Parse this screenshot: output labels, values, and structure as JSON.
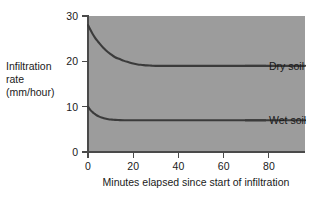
{
  "chart_data": {
    "type": "line",
    "title": "",
    "xlabel": "Minutes elapsed since start of infiltration",
    "ylabel": "Infiltration rate (mm/hour)",
    "ylabel_lines": [
      "Infiltration",
      "rate",
      "(mm/hour)"
    ],
    "xlim": [
      0,
      96
    ],
    "ylim": [
      0,
      30
    ],
    "xticks": [
      0,
      20,
      40,
      60,
      80
    ],
    "yticks": [
      0,
      10,
      20,
      30
    ],
    "xticklabels": [
      "0",
      "20",
      "40",
      "60",
      "80"
    ],
    "yticklabels": [
      "0",
      "10",
      "20",
      "30"
    ],
    "grid": false,
    "legend_position": "inline-right",
    "plot_background_color": "#9c9c9c",
    "line_color": "#3b3b3b",
    "series": [
      {
        "name": "Dry soil",
        "label": "Dry soil",
        "x": [
          0,
          1,
          2,
          3,
          4,
          5,
          6,
          7,
          8,
          10,
          12,
          14,
          16,
          18,
          20,
          22,
          24,
          26,
          28,
          30,
          40,
          50,
          60,
          70,
          80,
          90,
          96
        ],
        "values": [
          28.0,
          27.0,
          26.1,
          25.3,
          24.6,
          24.0,
          23.4,
          22.9,
          22.4,
          21.6,
          20.9,
          20.5,
          20.1,
          19.8,
          19.5,
          19.3,
          19.2,
          19.1,
          19.05,
          19.0,
          19.0,
          19.0,
          19.0,
          19.0,
          19.0,
          19.0,
          19.0
        ]
      },
      {
        "name": "Wet soil",
        "label": "Wet soil",
        "x": [
          0,
          1,
          2,
          3,
          4,
          5,
          6,
          7,
          8,
          9,
          10,
          11,
          12,
          14,
          16,
          20,
          30,
          40,
          50,
          60,
          70,
          80,
          90,
          96
        ],
        "values": [
          10.0,
          9.3,
          8.8,
          8.4,
          8.05,
          7.8,
          7.6,
          7.45,
          7.33,
          7.24,
          7.17,
          7.12,
          7.08,
          7.04,
          7.02,
          7.0,
          7.0,
          7.0,
          7.0,
          7.0,
          7.0,
          7.0,
          7.0,
          7.0
        ]
      }
    ],
    "annotations": [
      {
        "text": "Dry soil",
        "x": 82,
        "y": 19.0
      },
      {
        "text": "Wet soil",
        "x": 82,
        "y": 7.0
      }
    ]
  }
}
